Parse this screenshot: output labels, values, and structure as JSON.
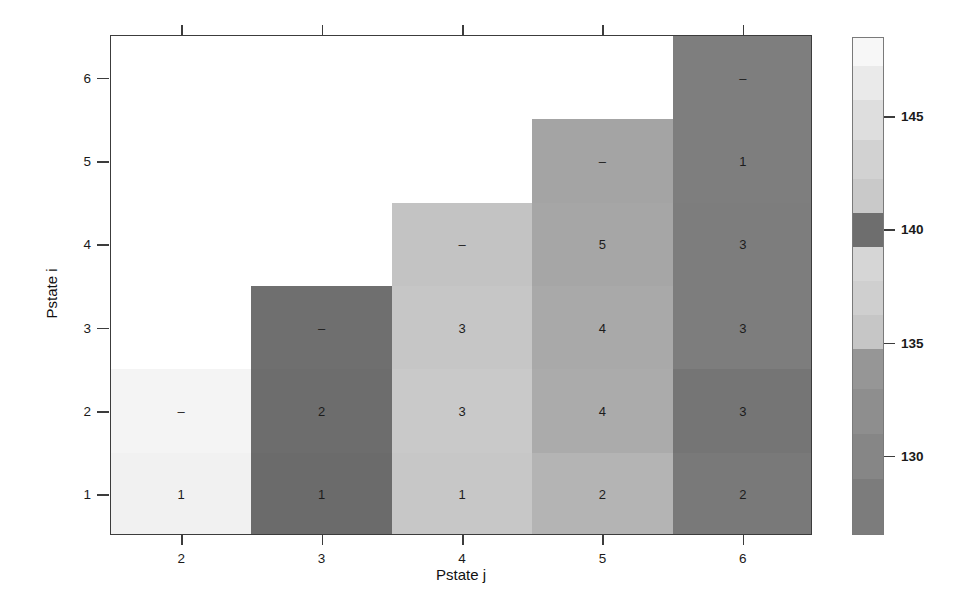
{
  "chart_data": {
    "type": "heatmap",
    "title": "",
    "xlabel": "Pstate j",
    "ylabel": "Pstate i",
    "x_ticks": [
      "2",
      "3",
      "4",
      "5",
      "6"
    ],
    "y_ticks": [
      "1",
      "2",
      "3",
      "4",
      "5",
      "6"
    ],
    "xlim": [
      1.5,
      6.5
    ],
    "ylim": [
      0.5,
      6.5
    ],
    "grid": false,
    "legend": "colorbar-right",
    "colorbar": {
      "ticks": [
        130,
        135,
        140,
        145
      ],
      "tick_labels": [
        "130",
        "135",
        "140",
        "145"
      ],
      "range": [
        126.5,
        148.5
      ],
      "bands": [
        {
          "value": 148.0,
          "color": "#f7f7f7"
        },
        {
          "value": 146.5,
          "color": "#eaeaea"
        },
        {
          "value": 145.0,
          "color": "#dedede"
        },
        {
          "value": 143.0,
          "color": "#d2d2d2"
        },
        {
          "value": 141.5,
          "color": "#c9c9c9"
        },
        {
          "value": 140.0,
          "color": "#6e6e6e"
        },
        {
          "value": 138.5,
          "color": "#d6d6d6"
        },
        {
          "value": 137.0,
          "color": "#cfcfcf"
        },
        {
          "value": 135.5,
          "color": "#c6c6c6"
        },
        {
          "value": 134.0,
          "color": "#969696"
        },
        {
          "value": 132.0,
          "color": "#8e8e8e"
        },
        {
          "value": 130.0,
          "color": "#868686"
        },
        {
          "value": 128.0,
          "color": "#7c7c7c"
        }
      ]
    },
    "columns": [
      {
        "x": 2,
        "top_i": 2.5,
        "cells": [
          {
            "i": 1,
            "label": "1",
            "color": "#f1f1f1",
            "value": 147.5
          },
          {
            "i": 2,
            "label": "–",
            "color": "#f4f4f4",
            "value": 148.0
          }
        ]
      },
      {
        "x": 3,
        "top_i": 3.5,
        "cells": [
          {
            "i": 1,
            "label": "1",
            "color": "#6b6b6b",
            "value": 129.0
          },
          {
            "i": 2,
            "label": "2",
            "color": "#6d6d6d",
            "value": 129.3
          },
          {
            "i": 3,
            "label": "–",
            "color": "#6f6f6f",
            "value": 129.6
          }
        ]
      },
      {
        "x": 4,
        "top_i": 4.5,
        "cells": [
          {
            "i": 1,
            "label": "1",
            "color": "#c7c7c7",
            "value": 141.0
          },
          {
            "i": 2,
            "label": "3",
            "color": "#c9c9c9",
            "value": 141.3
          },
          {
            "i": 3,
            "label": "3",
            "color": "#c6c6c6",
            "value": 140.9
          },
          {
            "i": 4,
            "label": "–",
            "color": "#c3c3c3",
            "value": 140.6
          }
        ]
      },
      {
        "x": 5,
        "top_i": 5.5,
        "cells": [
          {
            "i": 1,
            "label": "2",
            "color": "#b4b4b4",
            "value": 138.0
          },
          {
            "i": 2,
            "label": "4",
            "color": "#ababab",
            "value": 137.4
          },
          {
            "i": 3,
            "label": "4",
            "color": "#a9a9a9",
            "value": 137.2
          },
          {
            "i": 4,
            "label": "5",
            "color": "#a6a6a6",
            "value": 137.0
          },
          {
            "i": 5,
            "label": "–",
            "color": "#a4a4a4",
            "value": 136.8
          }
        ]
      },
      {
        "x": 6,
        "top_i": 6.5,
        "cells": [
          {
            "i": 1,
            "label": "2",
            "color": "#797979",
            "value": 130.5
          },
          {
            "i": 2,
            "label": "3",
            "color": "#757575",
            "value": 130.1
          },
          {
            "i": 3,
            "label": "3",
            "color": "#7d7d7d",
            "value": 131.0
          },
          {
            "i": 4,
            "label": "3",
            "color": "#7d7d7d",
            "value": 131.0
          },
          {
            "i": 5,
            "label": "1",
            "color": "#7e7e7e",
            "value": 131.2
          },
          {
            "i": 6,
            "label": "–",
            "color": "#7e7e7e",
            "value": 131.2
          }
        ]
      }
    ]
  }
}
